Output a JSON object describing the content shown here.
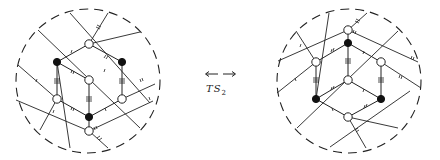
{
  "figure": {
    "operation": {
      "label_main": "TS",
      "label_sub": "2",
      "arrow": "bidirectional-dashed-arrow"
    },
    "left_disk": {
      "center": [
        88,
        81
      ],
      "radius": 72,
      "vertices": [
        {
          "id": "L1",
          "x": 89,
          "y": 44,
          "color": "white"
        },
        {
          "id": "L2",
          "x": 57,
          "y": 62,
          "color": "black"
        },
        {
          "id": "L3",
          "x": 122,
          "y": 62,
          "color": "black"
        },
        {
          "id": "L4",
          "x": 89,
          "y": 80,
          "color": "white"
        },
        {
          "id": "L5",
          "x": 57,
          "y": 99,
          "color": "white"
        },
        {
          "id": "L6",
          "x": 122,
          "y": 99,
          "color": "white"
        },
        {
          "id": "L7",
          "x": 89,
          "y": 117,
          "color": "black"
        },
        {
          "id": "L8",
          "x": 89,
          "y": 131,
          "color": "white"
        }
      ]
    },
    "right_disk": {
      "center": [
        349,
        81
      ],
      "radius": 72,
      "vertices": [
        {
          "id": "R1",
          "x": 348,
          "y": 30,
          "color": "white"
        },
        {
          "id": "R2",
          "x": 348,
          "y": 43,
          "color": "black"
        },
        {
          "id": "R3",
          "x": 316,
          "y": 62,
          "color": "white"
        },
        {
          "id": "R4",
          "x": 381,
          "y": 62,
          "color": "white"
        },
        {
          "id": "R5",
          "x": 348,
          "y": 80,
          "color": "white"
        },
        {
          "id": "R6",
          "x": 316,
          "y": 99,
          "color": "black"
        },
        {
          "id": "R7",
          "x": 381,
          "y": 99,
          "color": "black"
        },
        {
          "id": "R8",
          "x": 348,
          "y": 117,
          "color": "white"
        }
      ]
    }
  }
}
